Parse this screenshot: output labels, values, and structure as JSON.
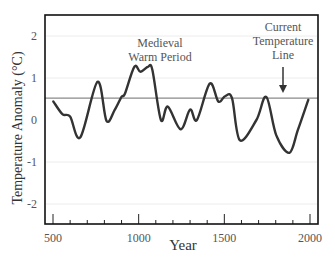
{
  "chart_data": {
    "type": "line",
    "title": "",
    "xlabel": "Year",
    "ylabel": "Temperature Anomaly (°C)",
    "xlim": [
      450,
      2045
    ],
    "ylim": [
      -2.5,
      2.5
    ],
    "x_ticks": [
      500,
      1000,
      1500,
      2000
    ],
    "x_minor_step": 100,
    "y_ticks": [
      2,
      1,
      0,
      -1,
      -2
    ],
    "grid": "faint horizontal",
    "legend": null,
    "reference_line": {
      "label": "Current Temperature Line",
      "value": 0.52,
      "color": "#8a8a8a"
    },
    "annotations": [
      {
        "text": "Medieval Warm Period",
        "x": 1000,
        "y": 1.7
      },
      {
        "text": "Current Temperature Line",
        "x": 1870,
        "y": 1.9,
        "arrow_to": 0.58
      }
    ],
    "series": [
      {
        "name": "Temperature Anomaly",
        "color": "#333333",
        "x": [
          502,
          555,
          600,
          660,
          760,
          812,
          860,
          900,
          920,
          975,
          1010,
          1055,
          1080,
          1130,
          1170,
          1245,
          1300,
          1340,
          1415,
          1465,
          1505,
          1545,
          1590,
          1687,
          1745,
          1803,
          1880,
          1929,
          1990
        ],
        "values": [
          0.44,
          0.14,
          0.08,
          -0.41,
          0.91,
          -0.02,
          0.24,
          0.55,
          0.63,
          1.27,
          1.15,
          1.27,
          1.19,
          0.0,
          0.32,
          -0.22,
          0.25,
          0.0,
          0.87,
          0.44,
          0.57,
          0.52,
          -0.48,
          0.0,
          0.55,
          -0.36,
          -0.78,
          -0.24,
          0.48
        ]
      }
    ]
  },
  "axes": {
    "xlabel": "Year",
    "ylabel": "Temperature Anomaly (°C)",
    "x_tick_labels": [
      "500",
      "1000",
      "1500",
      "2000"
    ],
    "y_tick_labels": [
      "2",
      "1",
      "0",
      "-1",
      "-2"
    ]
  },
  "annotations": {
    "mwp_line1": "Medieval",
    "mwp_line2": "Warm Period",
    "ctl_line1": "Current",
    "ctl_line2": "Temperature",
    "ctl_line3": "Line"
  }
}
